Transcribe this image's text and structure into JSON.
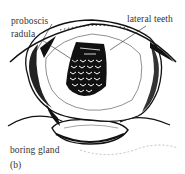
{
  "figure": {
    "panel_label": "(b)",
    "labels": {
      "proboscis": "proboscis",
      "radula": "radula",
      "lateral_teeth": "lateral teeth",
      "boring_gland": "boring gland"
    },
    "colors": {
      "ink": "#111111",
      "text": "#333333",
      "background": "#ffffff"
    }
  }
}
